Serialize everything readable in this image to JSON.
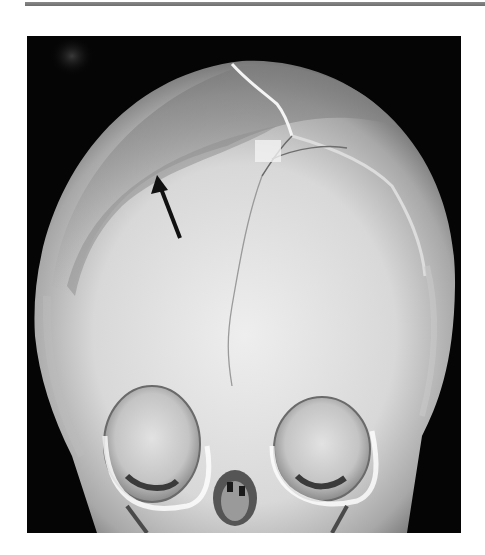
{
  "figure": {
    "annotation": {
      "type": "arrow",
      "color": "#111111",
      "tip": [
        157,
        175
      ],
      "tail": [
        180,
        238
      ],
      "direction": "up-left"
    },
    "colors": {
      "background": "#050505",
      "bone_light": "#e6e6e6",
      "bone_mid": "#b8b8b8",
      "bone_dark": "#7a7a7a",
      "top_rule": "#7a7a7a"
    },
    "caption": ""
  }
}
